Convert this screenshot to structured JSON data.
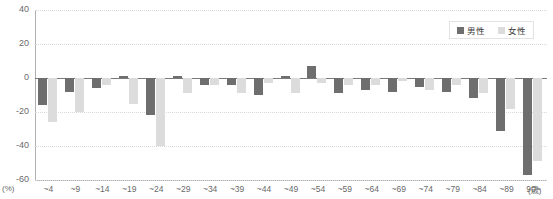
{
  "title_strip": "",
  "legend": {
    "position": "top-right",
    "entries": [
      {
        "label": "男性",
        "color": "#6e6e6e"
      },
      {
        "label": "女性",
        "color": "#dcdcdc"
      }
    ]
  },
  "axes": {
    "y_unit": "(%)",
    "x_unit": "(歳)",
    "y_ticks": [
      "40",
      "20",
      "0",
      "-20",
      "-40",
      "-60"
    ]
  },
  "chart_data": {
    "type": "bar",
    "title": "",
    "xlabel": "(歳)",
    "ylabel": "(%)",
    "ylim": [
      -60,
      40
    ],
    "yticks": [
      40,
      20,
      0,
      -20,
      -40,
      -60
    ],
    "grid": true,
    "legend_position": "top-right",
    "categories": [
      "~4",
      "~9",
      "~14",
      "~19",
      "~24",
      "~29",
      "~34",
      "~39",
      "~44",
      "~49",
      "~54",
      "~59",
      "~64",
      "~69",
      "~74",
      "~79",
      "~84",
      "~89",
      "90~"
    ],
    "series": [
      {
        "name": "男性",
        "color": "#6e6e6e",
        "values": [
          -16,
          -8,
          -6,
          1,
          -22,
          1,
          -4,
          -4,
          -10,
          1,
          7,
          -9,
          -7,
          -8,
          -5,
          -8,
          -12,
          -31,
          -57
        ]
      },
      {
        "name": "女性",
        "color": "#dcdcdc",
        "values": [
          -26,
          -20,
          -4,
          -15,
          -40,
          -9,
          -4,
          -9,
          -3,
          -9,
          -3,
          -4,
          -4,
          -2,
          -7,
          -4,
          -9,
          -18,
          -49
        ]
      }
    ]
  }
}
